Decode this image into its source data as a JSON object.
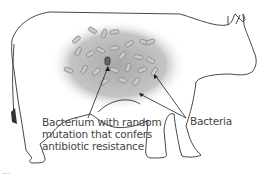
{
  "figure": {
    "labels": {
      "mutant": [
        "Bacterium with random",
        "mutation that confers",
        "antibiotic resistance"
      ],
      "bacteria": "Bacteria"
    },
    "caption_fragment": "...",
    "colors": {
      "outline": "#333333",
      "gut_shading": "#b8b8b8",
      "bacteria": "#9a9a9a",
      "mutant": "#555555",
      "text": "#444444"
    }
  }
}
